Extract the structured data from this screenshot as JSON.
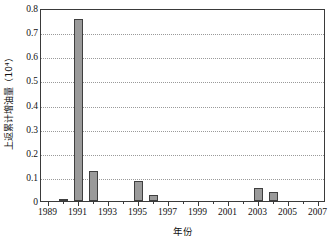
{
  "chart_data": {
    "type": "bar",
    "title": "",
    "xlabel": "年份",
    "ylabel": "上返累计增油量（10⁴）",
    "ylim": [
      0,
      0.8
    ],
    "ytick_values": [
      0,
      0.1,
      0.2,
      0.3,
      0.4,
      0.5,
      0.6,
      0.7,
      0.8
    ],
    "ytick_labels": [
      "0",
      "0.1",
      "0.2",
      "0.3",
      "0.4",
      "0.5",
      "0.6",
      "0.7",
      "0.8"
    ],
    "xlim": [
      1988.5,
      2007.5
    ],
    "xtick_values": [
      1989,
      1991,
      1993,
      1995,
      1997,
      1999,
      2001,
      2003,
      2005,
      2007
    ],
    "xtick_labels": [
      "1989",
      "1991",
      "1993",
      "1995",
      "1997",
      "1999",
      "2001",
      "2003",
      "2005",
      "2007"
    ],
    "grid": "horizontal-dotted",
    "legend": "none",
    "bar_color": "#9a9a9a",
    "bar_edge_color": "#3f3f3f",
    "axis_color": "#3a3a3a",
    "grid_color": "#9a9a9a",
    "categories": [
      1989,
      1990,
      1991,
      1992,
      1993,
      1994,
      1995,
      1996,
      1997,
      1998,
      1999,
      2000,
      2001,
      2002,
      2003,
      2004,
      2005,
      2006,
      2007
    ],
    "values": [
      0,
      0.004,
      0.755,
      0.125,
      0,
      0,
      0.085,
      0.025,
      0,
      0,
      0,
      0,
      0,
      0,
      0.053,
      0.036,
      0,
      0,
      0
    ]
  }
}
